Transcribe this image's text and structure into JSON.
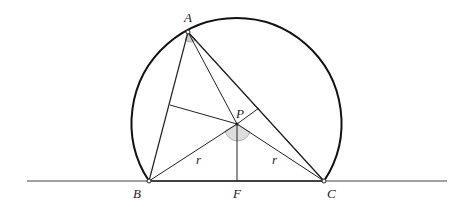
{
  "diagram": {
    "type": "geometry",
    "points": {
      "A": {
        "label": "A",
        "x": 188,
        "y": 32
      },
      "B": {
        "label": "B",
        "x": 149,
        "y": 181
      },
      "C": {
        "label": "C",
        "x": 324,
        "y": 181
      },
      "P": {
        "label": "P",
        "x": 237,
        "y": 124
      },
      "F": {
        "label": "F",
        "x": 237,
        "y": 181
      }
    },
    "segment_labels": {
      "PB": "r",
      "PC": "r"
    },
    "colors": {
      "stroke": "#222222",
      "angle_fill": "#cccccc"
    }
  }
}
